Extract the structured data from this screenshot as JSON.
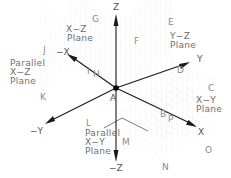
{
  "diagram": {
    "origin_label": "A",
    "axes": {
      "z_pos": "Z",
      "z_neg": "−Z",
      "x_pos": "X",
      "x_neg": "−X",
      "y_pos": "Y",
      "y_neg": "−Y"
    },
    "planes": {
      "xz": [
        "X−Z",
        "Plane"
      ],
      "parallel_xz": [
        "Parallel",
        "X−Z",
        "Plane"
      ],
      "yz": [
        "Y−Z",
        "Plane"
      ],
      "xy": [
        "X−Y",
        "Plane"
      ],
      "parallel_xy": [
        "Parallel",
        "X−Y",
        "Plane"
      ]
    },
    "points": {
      "B": "B",
      "C": "C",
      "D": "D",
      "E": "E",
      "F": "F",
      "G": "G",
      "H": "H",
      "I": "I",
      "J": "J",
      "K": "K",
      "L": "L",
      "M": "M",
      "N": "N",
      "O": "O",
      "P": "P"
    },
    "colors": {
      "axis": "#1a1a1a",
      "label": "#6e6e6e",
      "grid": "#e6e6e6"
    }
  }
}
